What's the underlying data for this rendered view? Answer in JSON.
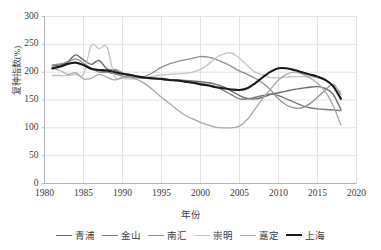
{
  "chart_data": {
    "type": "line",
    "title": "",
    "xlabel": "年份",
    "ylabel": "复种指数(%)",
    "xlim": [
      1980,
      2020
    ],
    "ylim": [
      0,
      300
    ],
    "grid": true,
    "legend_position": "bottom",
    "x_ticks": [
      "1980",
      "1985",
      "1990",
      "1995",
      "2000",
      "2005",
      "2010",
      "2015",
      "2020"
    ],
    "y_ticks": [
      "0",
      "50",
      "100",
      "150",
      "200",
      "250",
      "300"
    ],
    "x": [
      1981,
      1982,
      1983,
      1984,
      1985,
      1986,
      1987,
      1988,
      1989,
      1990,
      1991,
      1992,
      1993,
      1994,
      1995,
      1996,
      1997,
      1998,
      1999,
      2000,
      2001,
      2002,
      2003,
      2004,
      2005,
      2006,
      2007,
      2008,
      2009,
      2010,
      2011,
      2012,
      2013,
      2014,
      2015,
      2016,
      2017,
      2018
    ],
    "series": [
      {
        "name": "青浦",
        "color": "#6b6b6b",
        "width": 1.4,
        "values": [
          211,
          213,
          219,
          231,
          222,
          214,
          221,
          206,
          203,
          197,
          195,
          192,
          190,
          188,
          187,
          186,
          186,
          185,
          184,
          183,
          181,
          178,
          173,
          166,
          158,
          153,
          152,
          155,
          160,
          163,
          166,
          169,
          171,
          173,
          174,
          171,
          160,
          133
        ]
      },
      {
        "name": "金山",
        "color": "#7d7d7d",
        "width": 1.4,
        "values": [
          206,
          209,
          214,
          218,
          213,
          205,
          203,
          200,
          197,
          193,
          191,
          190,
          189,
          188,
          187,
          186,
          185,
          184,
          182,
          180,
          177,
          173,
          167,
          159,
          152,
          152,
          155,
          158,
          161,
          158,
          152,
          146,
          140,
          136,
          134,
          133,
          132,
          131
        ]
      },
      {
        "name": "南汇",
        "color": "#8f8f8f",
        "width": 1.3,
        "values": [
          213,
          215,
          218,
          224,
          216,
          207,
          200,
          200,
          205,
          199,
          192,
          190,
          193,
          200,
          209,
          215,
          219,
          222,
          225,
          228,
          227,
          223,
          217,
          210,
          202,
          196,
          189,
          180,
          168,
          152,
          141,
          136,
          136,
          143,
          155,
          168,
          178,
          160
        ]
      },
      {
        "name": "崇明",
        "color": "#c4c4c4",
        "width": 1.3,
        "values": [
          194,
          194,
          194,
          196,
          196,
          248,
          242,
          245,
          192,
          189,
          188,
          189,
          191,
          193,
          195,
          196,
          197,
          198,
          200,
          205,
          214,
          226,
          233,
          234,
          225,
          212,
          200,
          195,
          190,
          190,
          191,
          192,
          192,
          192,
          190,
          185,
          176,
          165
        ]
      },
      {
        "name": "嘉定",
        "color": "#a8a8a8",
        "width": 1.3,
        "values": [
          207,
          203,
          196,
          199,
          188,
          189,
          196,
          191,
          186,
          191,
          190,
          186,
          178,
          167,
          155,
          144,
          133,
          123,
          116,
          110,
          105,
          101,
          100,
          100,
          103,
          115,
          134,
          153,
          170,
          186,
          196,
          200,
          197,
          190,
          180,
          165,
          140,
          105
        ]
      },
      {
        "name": "上海",
        "color": "#1a1a1a",
        "width": 2.1,
        "values": [
          207,
          210,
          215,
          217,
          213,
          206,
          204,
          203,
          200,
          197,
          195,
          192,
          190,
          189,
          188,
          186,
          185,
          183,
          181,
          178,
          176,
          173,
          171,
          169,
          168,
          171,
          180,
          191,
          201,
          207,
          207,
          204,
          200,
          196,
          192,
          186,
          175,
          152
        ]
      }
    ]
  }
}
